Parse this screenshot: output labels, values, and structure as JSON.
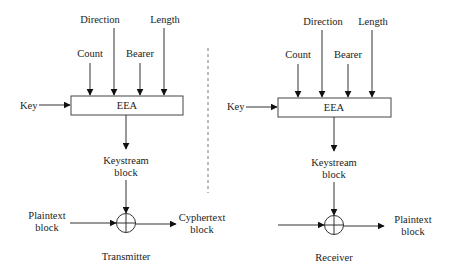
{
  "diagram": {
    "transmitter": {
      "title": "Transmitter",
      "inputs": {
        "count": "Count",
        "direction": "Direction",
        "bearer": "Bearer",
        "length": "Length",
        "key": "Key"
      },
      "algorithm": "EEA",
      "keystream_line1": "Keystream",
      "keystream_line2": "block",
      "input_line1": "Plaintext",
      "input_line2": "block",
      "output_line1": "Cyphertext",
      "output_line2": "block"
    },
    "receiver": {
      "title": "Receiver",
      "inputs": {
        "count": "Count",
        "direction": "Direction",
        "bearer": "Bearer",
        "length": "Length",
        "key": "Key"
      },
      "algorithm": "EEA",
      "keystream_line1": "Keystream",
      "keystream_line2": "block",
      "output_line1": "Plaintext",
      "output_line2": "block"
    },
    "operator_symbol": "xor-circle"
  }
}
